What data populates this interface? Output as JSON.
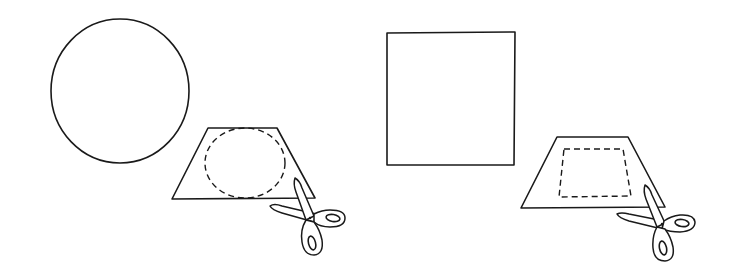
{
  "diagram": {
    "colors": {
      "ink": "#1a1a1a",
      "background": "#ffffff"
    },
    "panels": [
      {
        "id": "left",
        "target_shape": "circle",
        "paper_shape": "trapezoid",
        "cut_outline": "dashed-ellipse",
        "tool": "scissors-icon"
      },
      {
        "id": "right",
        "target_shape": "square",
        "paper_shape": "trapezoid",
        "cut_outline": "dashed-quadrilateral",
        "tool": "scissors-icon"
      }
    ]
  }
}
